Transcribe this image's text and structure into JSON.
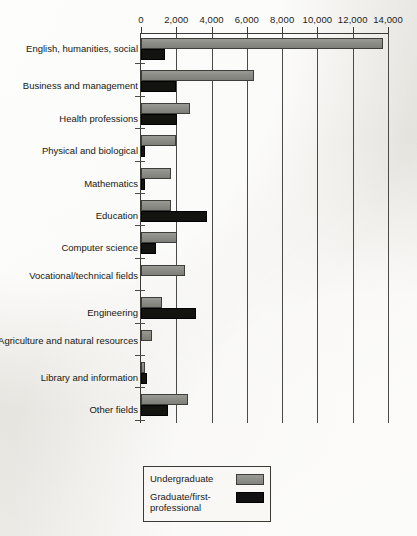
{
  "chart_data": {
    "type": "bar",
    "orientation": "horizontal",
    "title": "",
    "xlabel": "",
    "ylabel": "",
    "xlim": [
      0,
      14000
    ],
    "xticks": [
      "0",
      "2,000",
      "4,000",
      "6,000",
      "8,000",
      "10,000",
      "12,000",
      "14,000"
    ],
    "xtick_values": [
      0,
      2000,
      4000,
      6000,
      8000,
      10000,
      12000,
      14000
    ],
    "grid": "vertical",
    "legend_position": "bottom-left",
    "categories": [
      "English, humanities, social",
      "Business and management",
      "Health professions",
      "Physical and biological",
      "Mathematics",
      "Education",
      "Computer science",
      "Vocational/technical fields",
      "Engineering",
      "Agriculture and natural resources",
      "Library and information",
      "Other fields"
    ],
    "series": [
      {
        "name": "Undergraduate",
        "color": "#8d8d88",
        "values": [
          13700,
          6400,
          2800,
          2000,
          1700,
          1700,
          2050,
          2500,
          1200,
          620,
          200,
          2650
        ]
      },
      {
        "name": "Graduate/first-professional",
        "color": "#131310",
        "values": [
          1350,
          2000,
          2050,
          250,
          200,
          3750,
          850,
          0,
          3100,
          0,
          320,
          1550
        ]
      }
    ]
  },
  "legend": {
    "undergraduate_label": "Undergraduate",
    "graduate_label": "Graduate/first-professional"
  },
  "colors": {
    "undergraduate": "#8d8d88",
    "graduate": "#131310",
    "axis": "#3a3a36",
    "paper": "#efefea"
  }
}
